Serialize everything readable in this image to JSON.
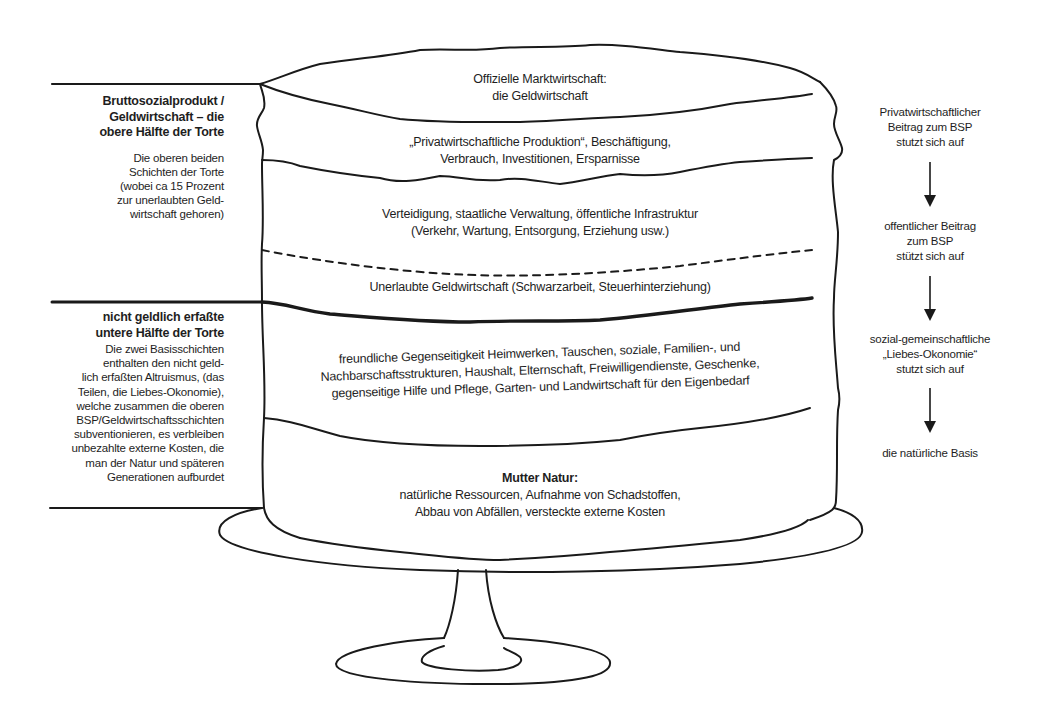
{
  "diagram": {
    "layers": [
      {
        "id": "official-market",
        "lines": [
          "Offizielle Marktwirtschaft:",
          "die Geldwirtschaft"
        ]
      },
      {
        "id": "private-production",
        "lines": [
          "„Privatwirtschaftliche Produktion“, Beschäftigung,",
          "Verbrauch, Investitionen, Ersparnisse"
        ]
      },
      {
        "id": "public-sector",
        "lines": [
          "Verteidigung, staatliche Verwaltung, öffentliche Infrastruktur",
          "(Verkehr, Wartung, Entsorgung, Erziehung usw.)"
        ]
      },
      {
        "id": "illegal-economy",
        "lines": [
          "Unerlaubte Geldwirtschaft (Schwarzarbeit, Steuerhinterziehung)"
        ]
      },
      {
        "id": "love-economy",
        "lines": [
          "freundliche Gegenseitigkeit  Heimwerken, Tauschen, soziale, Familien-, und",
          "Nachbarschaftsstrukturen, Haushalt, Elternschaft, Freiwilligendienste, Geschenke,",
          "gegenseitige Hilfe und Pflege, Garten- und Landwirtschaft für den Eigenbedarf"
        ]
      },
      {
        "id": "mother-nature",
        "heading": "Mutter Natur:",
        "lines": [
          "natürliche Ressourcen, Aufnahme von Schadstoffen,",
          "Abbau von Abfällen, versteckte externe Kosten"
        ]
      }
    ],
    "left_annotations": {
      "upper": {
        "heading": [
          "Bruttosozialprodukt /",
          "Geldwirtschaft – die",
          "obere Hälfte der Torte"
        ],
        "body": [
          "Die oberen beiden",
          "Schichten der Torte",
          "(wobei ca  15 Prozent",
          "zur unerlaubten Geld-",
          "wirtschaft gehoren)"
        ]
      },
      "lower": {
        "heading": [
          "nicht geldlich erfaßte",
          "untere Hälfte der Torte"
        ],
        "body": [
          "Die zwei Basisschichten",
          "enthalten den nicht geld-",
          "lich erfaßten Altruismus, (das",
          "Teilen, die Liebes-Okonomie),",
          "welche zusammen die oberen",
          "BSP/Geldwirtschaftsschichten",
          "subventionieren, es verbleiben",
          "unbezahlte externe Kosten, die",
          "man der Natur und späteren",
          "Generationen aufburdet"
        ]
      }
    },
    "right_flow": [
      {
        "lines": [
          "Privatwirtschaftlicher",
          "Beitrag zum BSP",
          "stutzt sich auf"
        ]
      },
      {
        "lines": [
          "offentlicher Beitrag",
          "zum BSP",
          "stützt sich auf"
        ]
      },
      {
        "lines": [
          "sozial-gemeinschaftliche",
          "„Liebes-Okonomie“",
          "stutzt sich auf"
        ]
      },
      {
        "lines": [
          "die natürliche Basis"
        ]
      }
    ],
    "colors": {
      "ink": "#1a1a1a",
      "background": "#ffffff"
    }
  }
}
